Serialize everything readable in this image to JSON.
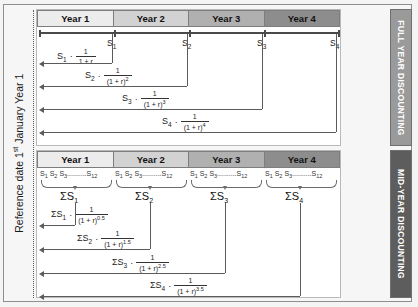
{
  "diagram": {
    "reference_label_prefix": "Reference date 1",
    "reference_label_sup": "st",
    "reference_label_suffix": " January Year 1",
    "bands": {
      "full": "FULL YEAR DISCOUNTING",
      "mid": "MID-YEAR DISCOUNTING"
    },
    "colors": {
      "band_full": "#9a9a9a",
      "band_mid": "#5d5d5d",
      "year1": "#ececec",
      "year2": "#d2d2d2",
      "year3": "#b0b0b0",
      "year4": "#8d8d8d",
      "line": "#5b5b5b",
      "page_bg": "#f4f4f4"
    },
    "years": [
      {
        "label": "Year 1"
      },
      {
        "label": "Year 2"
      },
      {
        "label": "Year 3"
      },
      {
        "label": "Year 4"
      }
    ]
  },
  "full_year": {
    "axis_flags": [
      {
        "base": "S",
        "sub": "1"
      },
      {
        "base": "S",
        "sub": "2"
      },
      {
        "base": "S",
        "sub": "3"
      },
      {
        "base": "S",
        "sub": "4"
      }
    ],
    "formulas": [
      {
        "lead_base": "S",
        "lead_sub": "1",
        "operator": "·",
        "numerator": "1",
        "denominator_base": "1 + r",
        "denominator_exp": "",
        "denominator_text": "1 + r"
      },
      {
        "lead_base": "S",
        "lead_sub": "2",
        "operator": "·",
        "numerator": "1",
        "denominator_base": "(1 + r)",
        "denominator_exp": "2",
        "denominator_text": "(1 + r)2"
      },
      {
        "lead_base": "S",
        "lead_sub": "3",
        "operator": "·",
        "numerator": "1",
        "denominator_base": "(1 + r)",
        "denominator_exp": "3",
        "denominator_text": "(1 + r)3"
      },
      {
        "lead_base": "S",
        "lead_sub": "4",
        "operator": "·",
        "numerator": "1",
        "denominator_base": "(1 + r)",
        "denominator_exp": "4",
        "denominator_text": "(1 + r)4"
      }
    ]
  },
  "mid_year": {
    "month_series": {
      "first": "S",
      "first_sub": "1",
      "second": "S",
      "second_sub": "2",
      "third": "S",
      "third_sub": "3",
      "ellipsis": "..........",
      "last": "S",
      "last_sub": "12"
    },
    "sums": [
      {
        "sigma": "ΣS",
        "sub": "1"
      },
      {
        "sigma": "ΣS",
        "sub": "2"
      },
      {
        "sigma": "ΣS",
        "sub": "3"
      },
      {
        "sigma": "ΣS",
        "sub": "4"
      }
    ],
    "formulas": [
      {
        "lead_base": "ΣS",
        "lead_sub": "1",
        "operator": "·",
        "numerator": "1",
        "denominator_base": "(1 + r)",
        "denominator_exp": "0.5"
      },
      {
        "lead_base": "ΣS",
        "lead_sub": "2",
        "operator": "·",
        "numerator": "1",
        "denominator_base": "(1 + r)",
        "denominator_exp": "1.5"
      },
      {
        "lead_base": "ΣS",
        "lead_sub": "3",
        "operator": "·",
        "numerator": "1",
        "denominator_base": "(1 + r)",
        "denominator_exp": "2.5"
      },
      {
        "lead_base": "ΣS",
        "lead_sub": "4",
        "operator": "·",
        "numerator": "1",
        "denominator_base": "(1 + r)",
        "denominator_exp": "3.5"
      }
    ]
  }
}
